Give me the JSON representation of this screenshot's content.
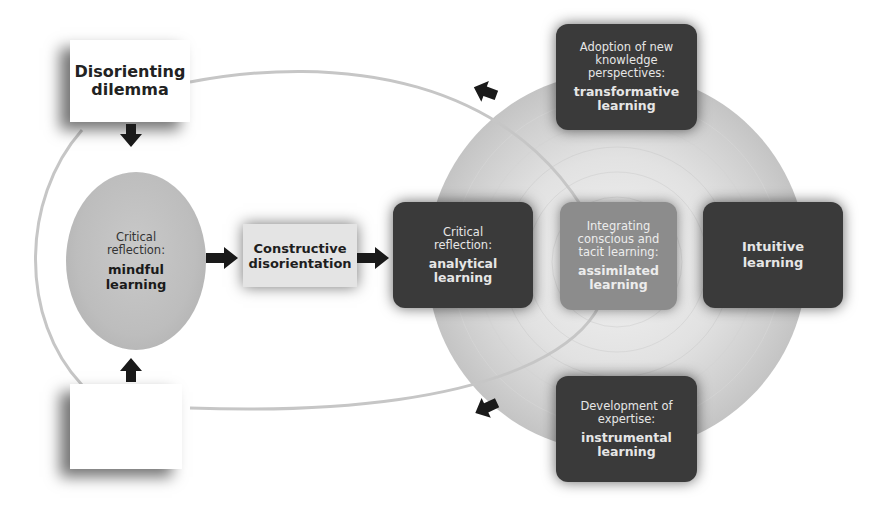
{
  "diagram": {
    "disorienting_dilemma": {
      "label_line1": "Disorienting",
      "label_line2": "dilemma"
    },
    "blank_box": {
      "label": ""
    },
    "mindful": {
      "sub_line1": "Critical",
      "sub_line2": "reflection:",
      "main_line1": "mindful",
      "main_line2": "learning"
    },
    "constructive": {
      "label_line1": "Constructive",
      "label_line2": "disorientation"
    },
    "analytical": {
      "sub_line1": "Critical",
      "sub_line2": "reflection:",
      "main_line1": "analytical",
      "main_line2": "learning"
    },
    "assimilated": {
      "sub_line1": "Integrating",
      "sub_line2": "conscious and",
      "sub_line3": "tacit learning:",
      "main_line1": "assimilated",
      "main_line2": "learning"
    },
    "intuitive": {
      "main_line1": "Intuitive",
      "main_line2": "learning"
    },
    "transformative": {
      "sub_line1": "Adoption of new",
      "sub_line2": "knowledge",
      "sub_line3": "perspectives:",
      "main_line1": "transformative",
      "main_line2": "learning"
    },
    "instrumental": {
      "sub_line1": "Development of",
      "sub_line2": "expertise:",
      "main_line1": "instrumental",
      "main_line2": "learning"
    },
    "colors": {
      "dark_box": "#3a3a3a",
      "mid_box": "#8c8c8c",
      "light_box": "#e4e4e4",
      "ellipse": "#bdbdbd",
      "arrow": "#1a1a1a",
      "cycle_line": "#c8c8c8"
    }
  }
}
